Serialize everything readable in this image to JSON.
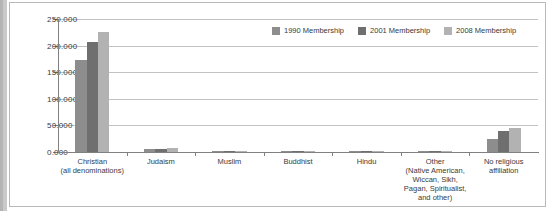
{
  "chart_data": {
    "type": "bar",
    "title": "",
    "subtitle": "",
    "xlabel": "",
    "ylabel": "",
    "ylim": [
      0,
      250
    ],
    "grid": true,
    "legend_position": "top-right",
    "y_ticks": [
      "0.000",
      "50.000",
      "100.000",
      "150.000",
      "200.000",
      "250.000"
    ],
    "y_tick_values": [
      0,
      50,
      100,
      150,
      200,
      250
    ],
    "categories": [
      "Christian\n(all denominations)",
      "Judaism",
      "Muslim",
      "Buddhist",
      "Hindu",
      "Other\n(Native American,\nWiccan, Sikh,\nPagan, Spiritualist,\nand other)",
      "No religious\naffiliation"
    ],
    "series": [
      {
        "name": "1990 Membership",
        "color": "#8d8d8d",
        "values": [
          173,
          5.5,
          1.2,
          1.0,
          0.6,
          1.0,
          25
        ]
      },
      {
        "name": "2001 Membership",
        "color": "#6f6f6f",
        "values": [
          207,
          6.5,
          1.8,
          1.4,
          0.9,
          1.4,
          39
        ]
      },
      {
        "name": "2008 Membership",
        "color": "#b2b2b2",
        "values": [
          225,
          7.5,
          2.2,
          1.6,
          1.1,
          1.8,
          46
        ]
      }
    ]
  },
  "legend": {
    "items": [
      {
        "label": "1990 Membership"
      },
      {
        "label": "2001 Membership"
      },
      {
        "label": "2008 Membership"
      }
    ]
  }
}
